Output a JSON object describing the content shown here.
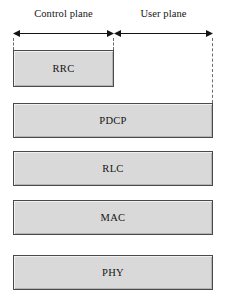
{
  "diagram": {
    "planes": [
      {
        "id": "control",
        "label": "Control plane"
      },
      {
        "id": "user",
        "label": "User plane"
      }
    ],
    "layers": [
      {
        "id": "rrc",
        "name": "RRC",
        "span": "control-plane"
      },
      {
        "id": "pdcp",
        "name": "PDCP",
        "span": "full"
      },
      {
        "id": "rlc",
        "name": "RLC",
        "span": "full"
      },
      {
        "id": "mac",
        "name": "MAC",
        "span": "full"
      },
      {
        "id": "phy",
        "name": "PHY",
        "span": "full"
      }
    ],
    "style": {
      "box_fill": "#d9d9d9",
      "box_border": "#4a4a4a",
      "line_color": "#141414",
      "guide_color": "#6b6b6b",
      "background": "#ffffff"
    }
  }
}
